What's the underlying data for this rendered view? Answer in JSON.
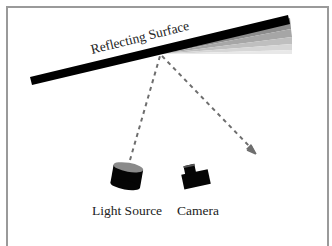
{
  "diagram": {
    "surface_label": "Reflecting Surface",
    "light_label": "Light Source",
    "camera_label": "Camera",
    "colors": {
      "frame": "#9a9a9a",
      "surface": "#000000",
      "wedge_bands": [
        "#8c8c8c",
        "#a6a6a6",
        "#bfbfbf",
        "#d6d6d6",
        "#e8e8e8"
      ],
      "ray": "#6e6e6e",
      "object": "#050505",
      "cylinder_top": "#8a8a8a",
      "text": "#222222"
    }
  }
}
